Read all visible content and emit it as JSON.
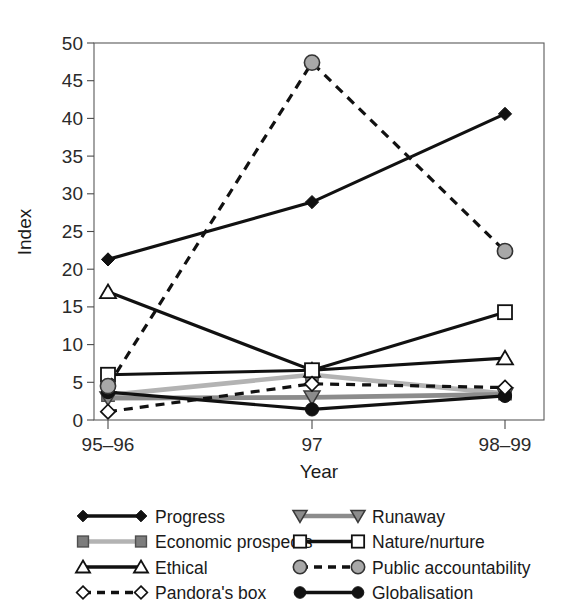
{
  "chart_data": {
    "type": "line",
    "title": "",
    "xlabel": "Year",
    "ylabel": "Index",
    "categories": [
      "95–96",
      "97",
      "98–99"
    ],
    "x_tick_labels": [
      "95–96",
      "97",
      "98–99"
    ],
    "y_tick_labels": [
      "0",
      "5",
      "10",
      "15",
      "20",
      "25",
      "30",
      "35",
      "40",
      "45",
      "50"
    ],
    "y_ticks": [
      0,
      5,
      10,
      15,
      20,
      25,
      30,
      35,
      40,
      45,
      50
    ],
    "ylim": [
      0,
      50
    ],
    "grid": false,
    "legend_position": "bottom",
    "series": [
      {
        "name": "Progress",
        "values": [
          21.3,
          28.9,
          40.6
        ],
        "marker": "filled-diamond",
        "line_style": "solid",
        "color": "#111111",
        "marker_fill": "#111111"
      },
      {
        "name": "Economic prospects",
        "values": [
          3.3,
          6.0,
          3.5
        ],
        "marker": "filled-square",
        "line_style": "solid",
        "color": "#b3b3b3",
        "marker_fill": "#7d7d7d"
      },
      {
        "name": "Ethical",
        "values": [
          17.0,
          6.6,
          8.2
        ],
        "marker": "open-triangle-up",
        "line_style": "solid",
        "color": "#111111",
        "marker_fill": "#ffffff"
      },
      {
        "name": "Pandora's box",
        "values": [
          1.1,
          4.8,
          4.3
        ],
        "marker": "open-diamond",
        "line_style": "dashed",
        "color": "#111111",
        "marker_fill": "#ffffff"
      },
      {
        "name": "Runaway",
        "values": [
          2.9,
          3.0,
          3.4
        ],
        "marker": "filled-triangle-down",
        "line_style": "solid",
        "color": "#8c8c8c",
        "marker_fill": "#8c8c8c"
      },
      {
        "name": "Nature/nurture",
        "values": [
          6.0,
          6.6,
          14.3
        ],
        "marker": "open-square",
        "line_style": "solid",
        "color": "#111111",
        "marker_fill": "#ffffff"
      },
      {
        "name": "Public accountability",
        "values": [
          4.5,
          47.4,
          22.4
        ],
        "marker": "filled-circle-gray",
        "line_style": "dashed",
        "color": "#111111",
        "marker_fill": "#a8a8a8"
      },
      {
        "name": "Globalisation",
        "values": [
          3.7,
          1.4,
          3.2
        ],
        "marker": "filled-circle",
        "line_style": "solid",
        "color": "#111111",
        "marker_fill": "#111111"
      }
    ]
  },
  "legend": {
    "columns": [
      [
        "Progress",
        "Economic prospects",
        "Ethical",
        "Pandora's box"
      ],
      [
        "Runaway",
        "Nature/nurture",
        "Public accountability",
        "Globalisation"
      ]
    ]
  },
  "colors": {
    "axis": "#4a4a4a",
    "text": "#1a1a1a",
    "dark_line": "#111111",
    "gray_line": "#b3b3b3",
    "mid_gray": "#8c8c8c",
    "marker_gray": "#a8a8a8",
    "background": "#ffffff"
  }
}
